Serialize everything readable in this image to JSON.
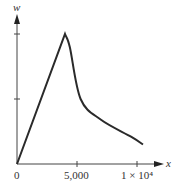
{
  "chart_data": {
    "type": "line",
    "title": "",
    "xlabel": "x",
    "ylabel": "w",
    "x_ticks": [
      {
        "value": 0,
        "label": "0"
      },
      {
        "value": 5000,
        "label": "5,000"
      },
      {
        "value": 10000,
        "label": "1 × 10⁴"
      }
    ],
    "y_ticks": [
      {
        "value": 0
      },
      {
        "value": 1
      },
      {
        "value": 2
      }
    ],
    "xlim": [
      0,
      12000
    ],
    "ylim": [
      0,
      2.3
    ],
    "grid": false,
    "legend": null,
    "series": [
      {
        "name": "w(x)",
        "x": [
          0,
          4000,
          4400,
          5300,
          7000,
          9500,
          10500
        ],
        "y": [
          0,
          2.0,
          1.8,
          1.0,
          0.68,
          0.42,
          0.3
        ]
      }
    ],
    "color": "#2a2a2a"
  },
  "labels": {
    "ylabel": "w",
    "xlabel": "x",
    "origin": "0",
    "tick_5000": "5,000",
    "tick_1e4": "1 × 10⁴"
  }
}
